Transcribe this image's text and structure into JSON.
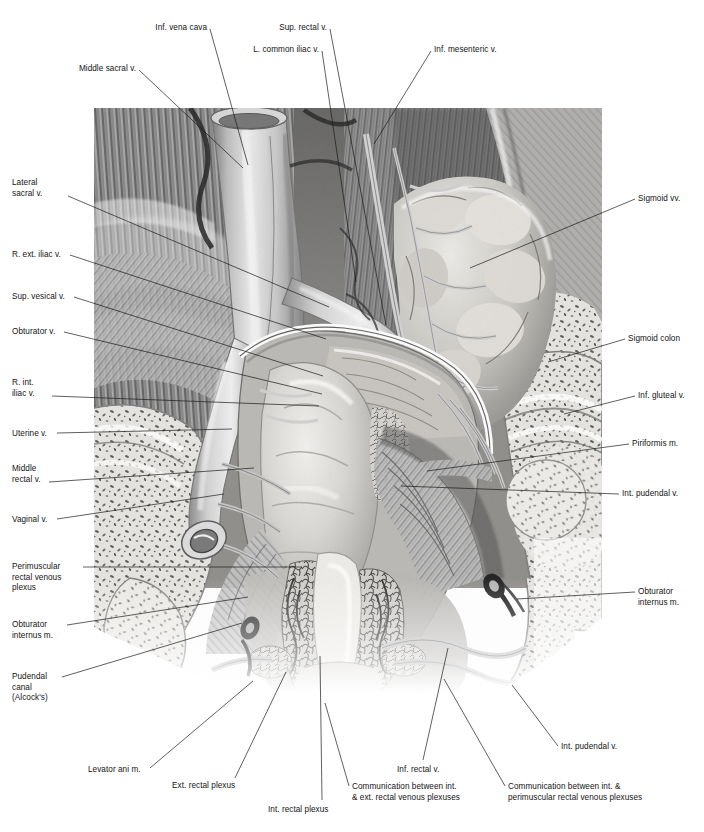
{
  "figure": {
    "style": "grayscale pencil-and-wash medical illustration",
    "canvas": {
      "width": 704,
      "height": 832
    },
    "artwork_box": {
      "x": 94,
      "y": 108,
      "width": 508,
      "height": 586
    },
    "ink_color": "#1b1b1b",
    "background_color": "#ffffff"
  },
  "labels": {
    "top": [
      {
        "id": "middle-sacral-v",
        "text": "Middle sacral v.",
        "align": "right",
        "x": 136,
        "y": 64,
        "leader": [
          [
            139,
            70
          ],
          [
            243,
            168
          ]
        ]
      },
      {
        "id": "inf-vena-cava",
        "text": "Inf. vena cava",
        "align": "right",
        "x": 207,
        "y": 23,
        "leader": [
          [
            210,
            29
          ],
          [
            248,
            165
          ]
        ]
      },
      {
        "id": "l-common-iliac-v",
        "text": "L. common iliac v.",
        "align": "right",
        "x": 319,
        "y": 45,
        "leader": [
          [
            322,
            51
          ],
          [
            356,
            282
          ]
        ]
      },
      {
        "id": "sup-rectal-v",
        "text": "Sup. rectal v.",
        "align": "right",
        "x": 327,
        "y": 23,
        "leader": [
          [
            330,
            29
          ],
          [
            386,
            325
          ]
        ]
      },
      {
        "id": "inf-mesenteric-v",
        "text": "Inf. mesenteric v.",
        "align": "left",
        "x": 434,
        "y": 45,
        "leader": [
          [
            431,
            51
          ],
          [
            374,
            144
          ]
        ]
      }
    ],
    "left": [
      {
        "id": "lateral-sacral-v",
        "text": "Lateral\nsacral v.",
        "align": "left",
        "x": 12,
        "y": 178,
        "leader": [
          [
            68,
            196
          ],
          [
            329,
            307
          ]
        ]
      },
      {
        "id": "r-ext-iliac-v",
        "text": "R. ext. iliac v.",
        "align": "left",
        "x": 12,
        "y": 250,
        "leader": [
          [
            70,
            255
          ],
          [
            326,
            339
          ]
        ]
      },
      {
        "id": "sup-vesical-v",
        "text": "Sup. vesical v.",
        "align": "left",
        "x": 12,
        "y": 292,
        "leader": [
          [
            74,
            297
          ],
          [
            323,
            376
          ]
        ]
      },
      {
        "id": "obturator-v",
        "text": "Obturator v.",
        "align": "left",
        "x": 12,
        "y": 327,
        "leader": [
          [
            64,
            332
          ],
          [
            322,
            394
          ]
        ]
      },
      {
        "id": "r-int-iliac-v",
        "text": "R. int.\niliac v.",
        "align": "left",
        "x": 12,
        "y": 378,
        "leader": [
          [
            52,
            396
          ],
          [
            319,
            406
          ]
        ]
      },
      {
        "id": "uterine-v",
        "text": "Uterine v.",
        "align": "left",
        "x": 12,
        "y": 429,
        "leader": [
          [
            57,
            433
          ],
          [
            232,
            429
          ]
        ]
      },
      {
        "id": "middle-rectal-v",
        "text": "Middle\nrectal v.",
        "align": "left",
        "x": 12,
        "y": 464,
        "leader": [
          [
            49,
            482
          ],
          [
            254,
            468
          ]
        ]
      },
      {
        "id": "vaginal-v",
        "text": "Vaginal v.",
        "align": "left",
        "x": 12,
        "y": 515,
        "leader": [
          [
            57,
            519
          ],
          [
            224,
            494
          ]
        ]
      },
      {
        "id": "perimuscular-rectal-venous-plexus",
        "text": "Perimuscular\nrectal venous\nplexus",
        "align": "left",
        "x": 12,
        "y": 562,
        "leader": [
          [
            83,
            567
          ],
          [
            302,
            567
          ]
        ]
      },
      {
        "id": "obturator-internus-m-left",
        "text": "Obturator\ninternus m.",
        "align": "left",
        "x": 12,
        "y": 620,
        "leader": [
          [
            67,
            625
          ],
          [
            248,
            597
          ]
        ]
      },
      {
        "id": "pudendal-canal-alcocks",
        "text": "Pudendal\ncanal\n(Alcock's)",
        "align": "left",
        "x": 12,
        "y": 672,
        "leader": [
          [
            62,
            677
          ],
          [
            242,
            623
          ]
        ]
      }
    ],
    "right": [
      {
        "id": "sigmoid-vv",
        "text": "Sigmoid vv.",
        "align": "left",
        "x": 638,
        "y": 194,
        "leader": [
          [
            635,
            199
          ],
          [
            470,
            268
          ]
        ]
      },
      {
        "id": "sigmoid-colon",
        "text": "Sigmoid colon",
        "align": "left",
        "x": 628,
        "y": 334,
        "leader": [
          [
            625,
            339
          ],
          [
            548,
            362
          ]
        ]
      },
      {
        "id": "inf-gluteal-v",
        "text": "Inf. gluteal v.",
        "align": "left",
        "x": 638,
        "y": 391,
        "leader": [
          [
            635,
            396
          ],
          [
            564,
            414
          ]
        ]
      },
      {
        "id": "piriformis-m",
        "text": "Piriformis m.",
        "align": "left",
        "x": 632,
        "y": 439,
        "leader": [
          [
            629,
            444
          ],
          [
            427,
            471
          ]
        ]
      },
      {
        "id": "int-pudendal-v-right",
        "text": "Int. pudendal v.",
        "align": "left",
        "x": 622,
        "y": 489,
        "leader": [
          [
            619,
            494
          ],
          [
            401,
            486
          ]
        ]
      },
      {
        "id": "obturator-internus-m-right",
        "text": "Obturator\ninternus m.",
        "align": "left",
        "x": 638,
        "y": 587,
        "leader": [
          [
            635,
            592
          ],
          [
            517,
            599
          ]
        ]
      }
    ],
    "bottom": [
      {
        "id": "levator-ani-m",
        "text": "Levator ani m.",
        "align": "left",
        "x": 88,
        "y": 765,
        "leader": [
          [
            150,
            768
          ],
          [
            253,
            681
          ]
        ]
      },
      {
        "id": "ext-rectal-plexus",
        "text": "Ext. rectal plexus",
        "align": "left",
        "x": 172,
        "y": 781,
        "leader": [
          [
            235,
            778
          ],
          [
            286,
            672
          ]
        ]
      },
      {
        "id": "int-rectal-plexus",
        "text": "Int. rectal plexus",
        "align": "left",
        "x": 268,
        "y": 805,
        "leader": [
          [
            322,
            800
          ],
          [
            320,
            656
          ]
        ]
      },
      {
        "id": "communication-int-ext",
        "text": "Communication between int.\n& ext. rectal venous plexuses",
        "align": "left",
        "x": 352,
        "y": 782,
        "leader": [
          [
            349,
            786
          ],
          [
            325,
            703
          ]
        ]
      },
      {
        "id": "inf-rectal-v",
        "text": "Inf. rectal v.",
        "align": "left",
        "x": 397,
        "y": 765,
        "leader": [
          [
            423,
            760
          ],
          [
            448,
            648
          ]
        ]
      },
      {
        "id": "communication-int-perimuscular",
        "text": "Communication between int. &\nperimuscular rectal venous plexuses",
        "align": "left",
        "x": 508,
        "y": 782,
        "leader": [
          [
            505,
            786
          ],
          [
            444,
            679
          ]
        ]
      },
      {
        "id": "int-pudendal-v-bottom",
        "text": "Int. pudendal v.",
        "align": "left",
        "x": 561,
        "y": 742,
        "leader": [
          [
            558,
            746
          ],
          [
            512,
            685
          ]
        ]
      }
    ]
  },
  "artwork_regions": [
    {
      "id": "iliacus-psoas-muscle",
      "label": "striated muscle field, upper left"
    },
    {
      "id": "inferior-vena-cava-trunk",
      "label": "large pale vein trunk, center-upper-left"
    },
    {
      "id": "common-iliac-veins",
      "label": "bifurcating venous trunks"
    },
    {
      "id": "sigmoid-colon-body",
      "label": "haustrated bowel, upper right"
    },
    {
      "id": "sigmoid-vessels",
      "label": "branching vein arcade on sigmoid mesentery"
    },
    {
      "id": "rectum-body",
      "label": "large smooth rectal ampulla, center"
    },
    {
      "id": "rectal-venous-plexus",
      "label": "fine reticulated vein network in rectal wall"
    },
    {
      "id": "anal-canal",
      "label": "narrow distal canal, lower center"
    },
    {
      "id": "pelvic-bone-trabeculae",
      "label": "stippled cancellous bone, right"
    },
    {
      "id": "sacrum-cut-surface",
      "label": "stippled cancellous bone, left"
    },
    {
      "id": "levator-ani-sheet",
      "label": "fanned muscle sheet flanking rectum"
    },
    {
      "id": "pudendal-vessels",
      "label": "curving paired vessels, lower right"
    }
  ]
}
